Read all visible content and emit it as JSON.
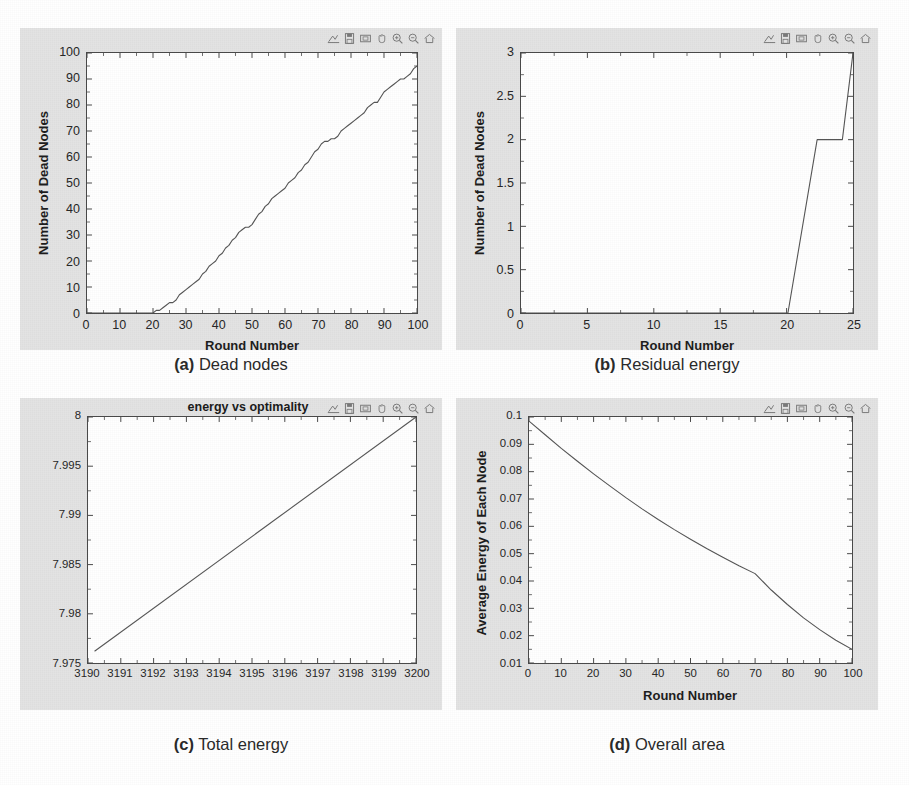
{
  "toolbar": {
    "buttons": [
      {
        "name": "subplot-config-icon",
        "label": "Configure subplots"
      },
      {
        "name": "save-icon",
        "label": "Save"
      },
      {
        "name": "print-icon",
        "label": "Print"
      },
      {
        "name": "pan-icon",
        "label": "Pan"
      },
      {
        "name": "zoom-in-icon",
        "label": "Zoom in"
      },
      {
        "name": "zoom-out-icon",
        "label": "Zoom out"
      },
      {
        "name": "home-icon",
        "label": "Home / reset view"
      }
    ]
  },
  "captions": {
    "a_tag": "(a)",
    "a_text": " Dead nodes",
    "b_tag": "(b)",
    "b_text": " Residual energy",
    "c_tag": "(c)",
    "c_text": " Total energy",
    "d_tag": "(d)",
    "d_text": " Overall area"
  },
  "chart_data": [
    {
      "id": "panel-a",
      "type": "line",
      "title": "",
      "xlabel": "Round Number",
      "ylabel": "Number of Dead Nodes",
      "xlim": [
        0,
        100
      ],
      "ylim": [
        0,
        100
      ],
      "xticks": [
        0,
        10,
        20,
        30,
        40,
        50,
        60,
        70,
        80,
        90,
        100
      ],
      "xticklabels": [
        "0",
        "10",
        "20",
        "30",
        "40",
        "50",
        "60",
        "70",
        "80",
        "90",
        "100"
      ],
      "yticks": [
        0,
        10,
        20,
        30,
        40,
        50,
        60,
        70,
        80,
        90,
        100
      ],
      "yticklabels": [
        "0",
        "10",
        "20",
        "30",
        "40",
        "50",
        "60",
        "70",
        "80",
        "90",
        "100"
      ],
      "grid": false,
      "legend": null,
      "line_color": "#555555",
      "series": [
        {
          "name": "dead nodes",
          "x": [
            0,
            5,
            10,
            15,
            20,
            21,
            22,
            23,
            24,
            25,
            26,
            27,
            28,
            29,
            30,
            31,
            32,
            33,
            34,
            35,
            36,
            37,
            38,
            39,
            40,
            41,
            42,
            43,
            44,
            45,
            46,
            47,
            48,
            49,
            50,
            51,
            52,
            53,
            54,
            55,
            56,
            57,
            58,
            59,
            60,
            61,
            62,
            63,
            64,
            65,
            66,
            67,
            68,
            69,
            70,
            71,
            72,
            73,
            74,
            75,
            76,
            77,
            78,
            79,
            80,
            81,
            82,
            83,
            84,
            85,
            86,
            87,
            88,
            89,
            90,
            91,
            92,
            93,
            94,
            95,
            96,
            97,
            98,
            99,
            100
          ],
          "y": [
            0,
            0,
            0,
            0,
            0,
            1,
            1,
            2,
            3,
            4,
            4,
            5,
            7,
            8,
            9,
            10,
            11,
            12,
            13,
            15,
            16,
            18,
            19,
            20,
            22,
            23,
            25,
            26,
            28,
            29,
            31,
            32,
            33,
            33,
            34,
            36,
            38,
            39,
            41,
            42,
            44,
            45,
            46,
            47,
            48,
            50,
            51,
            52,
            54,
            55,
            57,
            58,
            60,
            62,
            63,
            65,
            66,
            66,
            67,
            67,
            68,
            70,
            71,
            72,
            73,
            74,
            75,
            76,
            77,
            79,
            80,
            81,
            81,
            83,
            85,
            86,
            87,
            88,
            89,
            90,
            90,
            91,
            92,
            94,
            95
          ]
        }
      ]
    },
    {
      "id": "panel-b",
      "type": "line",
      "title": "",
      "xlabel": "Round Number",
      "ylabel": "Number of Dead Nodes",
      "xlim": [
        0,
        25
      ],
      "ylim": [
        0,
        3
      ],
      "xticks": [
        0,
        5,
        10,
        15,
        20,
        25
      ],
      "xticklabels": [
        "0",
        "5",
        "10",
        "15",
        "20",
        "25"
      ],
      "yticks": [
        0,
        0.5,
        1,
        1.5,
        2,
        2.5,
        3
      ],
      "yticklabels": [
        "0",
        "0.5",
        "1",
        "1.5",
        "2",
        "2.5",
        "3"
      ],
      "grid": false,
      "legend": null,
      "line_color": "#555555",
      "series": [
        {
          "name": "dead nodes",
          "x": [
            0,
            20.1,
            22.3,
            24.2,
            25
          ],
          "y": [
            0,
            0,
            2,
            2,
            3
          ]
        }
      ]
    },
    {
      "id": "panel-c",
      "type": "line",
      "title": "energy vs optimality",
      "xlabel": "",
      "ylabel": "",
      "xlim": [
        3190,
        3200
      ],
      "ylim": [
        7.975,
        8
      ],
      "xticks": [
        3190,
        3191,
        3192,
        3193,
        3194,
        3195,
        3196,
        3197,
        3198,
        3199,
        3200
      ],
      "xticklabels": [
        "3190",
        "3191",
        "3192",
        "3193",
        "3194",
        "3195",
        "3196",
        "3197",
        "3198",
        "3199",
        "3200"
      ],
      "yticks": [
        7.975,
        7.98,
        7.985,
        7.99,
        7.995,
        8
      ],
      "yticklabels": [
        "7.975",
        "7.98",
        "7.985",
        "7.99",
        "7.995",
        "8"
      ],
      "grid": false,
      "legend": null,
      "line_color": "#555555",
      "series": [
        {
          "name": "energy",
          "x": [
            3190.2,
            3200
          ],
          "y": [
            7.9762,
            8.0
          ]
        }
      ]
    },
    {
      "id": "panel-d",
      "type": "line",
      "title": "",
      "xlabel": "Round Number",
      "ylabel": "Average Energy of Each Node",
      "xlim": [
        0,
        100
      ],
      "ylim": [
        0.01,
        0.1
      ],
      "xticks": [
        0,
        10,
        20,
        30,
        40,
        50,
        60,
        70,
        80,
        90,
        100
      ],
      "xticklabels": [
        "0",
        "10",
        "20",
        "30",
        "40",
        "50",
        "60",
        "70",
        "80",
        "90",
        "100"
      ],
      "yticks": [
        0.01,
        0.02,
        0.03,
        0.04,
        0.05,
        0.06,
        0.07,
        0.08,
        0.09,
        0.1
      ],
      "yticklabels": [
        "0.01",
        "0.02",
        "0.03",
        "0.04",
        "0.05",
        "0.06",
        "0.07",
        "0.08",
        "0.09",
        "0.1"
      ],
      "grid": false,
      "legend": null,
      "line_color": "#555555",
      "series": [
        {
          "name": "average energy",
          "x": [
            0,
            5,
            10,
            15,
            20,
            25,
            30,
            35,
            40,
            45,
            50,
            55,
            60,
            65,
            70,
            75,
            80,
            85,
            90,
            95,
            100
          ],
          "y": [
            0.0985,
            0.0935,
            0.0885,
            0.0838,
            0.0792,
            0.0748,
            0.0705,
            0.0664,
            0.0625,
            0.0588,
            0.0553,
            0.0519,
            0.0487,
            0.0456,
            0.0427,
            0.0367,
            0.0314,
            0.0265,
            0.0222,
            0.0183,
            0.015
          ]
        }
      ]
    }
  ]
}
